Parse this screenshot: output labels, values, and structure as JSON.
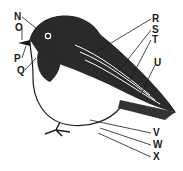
{
  "diagram": {
    "labels": [
      {
        "id": "N",
        "x": 14,
        "y": 12
      },
      {
        "id": "O",
        "x": 15,
        "y": 23
      },
      {
        "id": "P",
        "x": 14,
        "y": 54
      },
      {
        "id": "Q",
        "x": 17,
        "y": 66
      },
      {
        "id": "R",
        "x": 152,
        "y": 14
      },
      {
        "id": "S",
        "x": 152,
        "y": 25
      },
      {
        "id": "T",
        "x": 152,
        "y": 35
      },
      {
        "id": "U",
        "x": 154,
        "y": 58
      },
      {
        "id": "V",
        "x": 153,
        "y": 128
      },
      {
        "id": "W",
        "x": 153,
        "y": 140
      },
      {
        "id": "X",
        "x": 153,
        "y": 152
      }
    ],
    "colors": {
      "ink": "#1a1a1a",
      "background": "#ffffff"
    }
  }
}
